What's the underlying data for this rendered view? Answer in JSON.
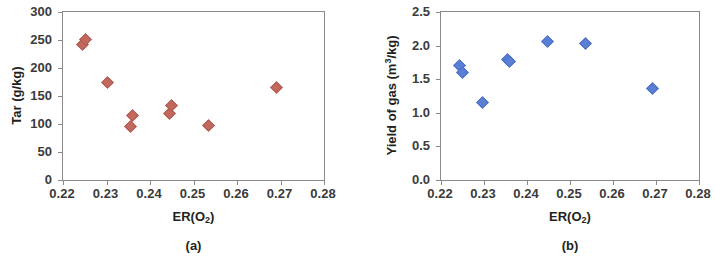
{
  "figure": {
    "panels": [
      {
        "id": "a",
        "caption": "(a)",
        "xlabel_prefix": "ER(O",
        "xlabel_sub": "2",
        "xlabel_suffix": ")",
        "ylabel": "Tar (g/kg)",
        "ylabel_prefix": "Tar (g/kg)",
        "ylabel_sub": "",
        "ylabel_suffix": "",
        "xticks": [
          "0.22",
          "0.23",
          "0.24",
          "0.25",
          "0.26",
          "0.27",
          "0.28"
        ],
        "yticks": [
          "0",
          "50",
          "100",
          "150",
          "200",
          "250",
          "300"
        ]
      },
      {
        "id": "b",
        "caption": "(b)",
        "xlabel_prefix": "ER(O",
        "xlabel_sub": "2",
        "xlabel_suffix": ")",
        "ylabel": "Yield of gas (m3/kg)",
        "ylabel_prefix": "Yield of gas (m",
        "ylabel_sub": "3",
        "ylabel_suffix": "/kg)",
        "xticks": [
          "0.22",
          "0.23",
          "0.24",
          "0.25",
          "0.26",
          "0.27",
          "0.28"
        ],
        "yticks": [
          "0.0",
          "0.5",
          "1.0",
          "1.5",
          "2.0",
          "2.5"
        ]
      }
    ]
  },
  "chart_data": [
    {
      "type": "scatter",
      "panel": "a",
      "title": "",
      "xlabel": "ER(O2)",
      "ylabel": "Tar (g/kg)",
      "xlim": [
        0.22,
        0.28
      ],
      "ylim": [
        0,
        300
      ],
      "xticks": [
        0.22,
        0.23,
        0.24,
        0.25,
        0.26,
        0.27,
        0.28
      ],
      "yticks": [
        0,
        50,
        100,
        150,
        200,
        250,
        300
      ],
      "grid": false,
      "legend": "none",
      "marker": "diamond",
      "color": "#c2695f",
      "series": [
        {
          "name": "Tar",
          "x": [
            0.2243,
            0.2249,
            0.23,
            0.2352,
            0.2357,
            0.2443,
            0.2447,
            0.2533,
            0.2688
          ],
          "y": [
            244,
            252,
            176,
            98,
            117,
            120,
            135,
            100,
            167
          ]
        }
      ]
    },
    {
      "type": "scatter",
      "panel": "b",
      "title": "",
      "xlabel": "ER(O2)",
      "ylabel": "Yield of gas (m3/kg)",
      "xlim": [
        0.22,
        0.28
      ],
      "ylim": [
        0.0,
        2.5
      ],
      "xticks": [
        0.22,
        0.23,
        0.24,
        0.25,
        0.26,
        0.27,
        0.28
      ],
      "yticks": [
        0.0,
        0.5,
        1.0,
        1.5,
        2.0,
        2.5
      ],
      "grid": false,
      "legend": "none",
      "marker": "diamond",
      "color": "#5b7fd4",
      "series": [
        {
          "name": "Yield of gas",
          "x": [
            0.224,
            0.2248,
            0.2295,
            0.2352,
            0.2358,
            0.2445,
            0.2533,
            0.269
          ],
          "y": [
            1.72,
            1.62,
            1.17,
            1.81,
            1.78,
            2.07,
            2.05,
            1.38
          ]
        }
      ]
    }
  ]
}
